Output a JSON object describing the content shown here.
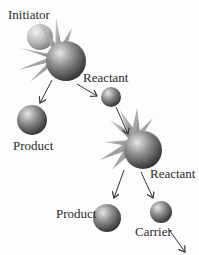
{
  "diagram": {
    "labels": {
      "initiator": "Initiator",
      "reactant1": "Reactant",
      "product1": "Product",
      "reactant2": "Reactant",
      "product2": "Product",
      "carrier": "Carrier"
    },
    "colors": {
      "sphere_light": "#d8d8d8",
      "sphere_mid": "#8a8a8a",
      "sphere_dark": "#3a3a3a",
      "arrow": "#333333",
      "text": "#2a2a2a"
    }
  }
}
